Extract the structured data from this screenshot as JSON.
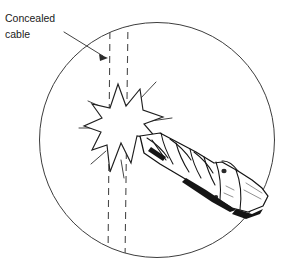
{
  "figure": {
    "type": "technical-line-illustration",
    "background_color": "#ffffff",
    "line_color": "#3d3d3d",
    "ink_color": "#141414"
  },
  "annotation": {
    "label_line_1": "Concealed",
    "label_line_2": "cable",
    "leader": {
      "from_x": 66,
      "from_y": 33,
      "to_x": 106,
      "to_y": 57,
      "arrow": "filled-triangle",
      "points_at": "left-cable-dashed-line"
    }
  },
  "scene": {
    "magnifier_circle": {
      "center_x": 157,
      "center_y": 140,
      "radius": 118,
      "stroke": "#3d3d3d"
    },
    "cable": {
      "description": "two vertical dashed lines representing a concealed cable run",
      "line_left_x": 109,
      "line_right_x": 127,
      "top_y": 22,
      "bottom_y": 258,
      "dash_pattern": "7 5",
      "stroke": "#4a4a4a"
    },
    "impact_burst": {
      "description": "jagged starburst marking the point where the drill hits the cable",
      "center_x": 118,
      "center_y": 125,
      "points": 8,
      "fill": "#ffffff",
      "stroke": "#1f1f1f",
      "spark_count": 7
    },
    "drill": {
      "description": "twist drill bit with helical flutes entering from lower right, held in a chuck",
      "tip_x": 140,
      "tip_y": 136,
      "chuck_x": 232,
      "chuck_y": 196,
      "flute_count": 4,
      "shading": "dark underside along chuck and shank"
    }
  }
}
